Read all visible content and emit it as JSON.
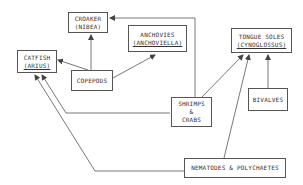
{
  "diagram": {
    "type": "food-web",
    "nodes": [
      {
        "id": "croaker",
        "label": "CROAKER",
        "sub": "(NIBEA)",
        "sub_underlined": false
      },
      {
        "id": "anchovies",
        "label": "ANCHOVIES",
        "sub": "(ANCHOVIELLA)",
        "sub_underlined": true
      },
      {
        "id": "catfish",
        "label": "CATFISH",
        "sub": "(ARIUS)",
        "sub_underlined": true
      },
      {
        "id": "copepods",
        "label": "COPEPODS"
      },
      {
        "id": "tongue_soles",
        "label": "TONGUE SOLES",
        "sub": "(CYNOGLOSSUS)",
        "sub_underlined": true
      },
      {
        "id": "shrimps_crabs",
        "label": "SHRIMPS",
        "mid": "&",
        "sub": "CRABS"
      },
      {
        "id": "bivalves",
        "label": "BIVALVES"
      },
      {
        "id": "nematodes",
        "label": "NEMATODES & POLYCHAETES"
      }
    ],
    "edges": [
      {
        "from": "copepods",
        "to": "croaker"
      },
      {
        "from": "copepods",
        "to": "catfish"
      },
      {
        "from": "copepods",
        "to": "anchovies"
      },
      {
        "from": "shrimps_crabs",
        "to": "croaker"
      },
      {
        "from": "shrimps_crabs",
        "to": "tongue_soles"
      },
      {
        "from": "shrimps_crabs",
        "to": "catfish"
      },
      {
        "from": "nematodes",
        "to": "catfish"
      },
      {
        "from": "nematodes",
        "to": "tongue_soles"
      },
      {
        "from": "bivalves",
        "to": "tongue_soles"
      }
    ],
    "line_color": "#555555"
  }
}
